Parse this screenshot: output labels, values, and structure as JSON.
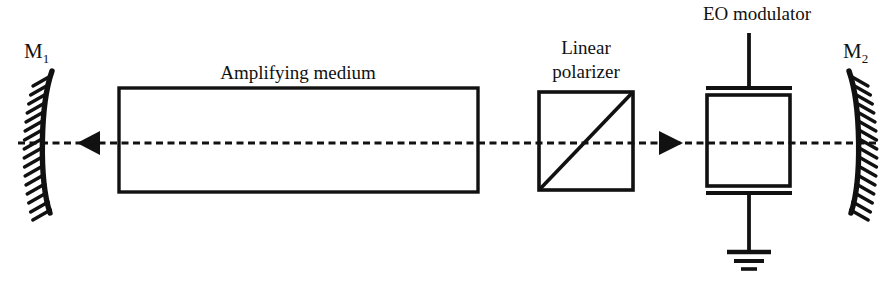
{
  "figure": {
    "background_color": "#ffffff",
    "line_color": "#111111",
    "width": 894,
    "height": 286
  },
  "labels": {
    "mirror_left": "M",
    "mirror_left_sub": "1",
    "mirror_right": "M",
    "mirror_right_sub": "2",
    "amplifying_medium": "Amplifying medium",
    "polarizer_line1": "Linear",
    "polarizer_line2": "polarizer",
    "eo_modulator": "EO modulator"
  },
  "components": {
    "mirror_left": {
      "name": "concave mirror M1",
      "hatch_count": 16,
      "hatch_side": "left",
      "axis_y": 143
    },
    "mirror_right": {
      "name": "concave mirror M2",
      "hatch_count": 16,
      "hatch_side": "right",
      "axis_y": 143
    },
    "amplifying_medium": {
      "shape": "rectangle",
      "x": 119,
      "y": 88,
      "width": 359,
      "height": 104
    },
    "linear_polarizer": {
      "shape": "square-with-diagonal",
      "x": 539,
      "y": 92,
      "width": 94,
      "height": 98,
      "diagonal": "bottom-left to top-right"
    },
    "eo_modulator": {
      "shape": "rectangle-with-electrodes",
      "x": 707,
      "y": 94,
      "width": 83,
      "height": 92,
      "top_electrode_y": 88,
      "bottom_electrode_y": 192,
      "lead_top_y": 33,
      "ground_symbol": true
    }
  },
  "beam_axis": {
    "name": "optical axis",
    "style": "dashed",
    "y": 143,
    "x_start": 18,
    "x_end": 880,
    "arrows": [
      {
        "direction": "left",
        "x": 88,
        "y": 143
      },
      {
        "direction": "right",
        "x": 670,
        "y": 143
      }
    ]
  }
}
